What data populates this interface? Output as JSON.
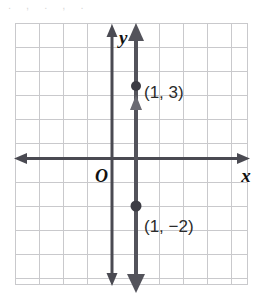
{
  "figure": {
    "top_cut_text": ". , . , .",
    "colors": {
      "grid": "#c9c9cc",
      "grid_border": "#bdbdc1",
      "axis": "#4a4a52",
      "line": "#53535b",
      "point": "#3c3c44",
      "label_text": "#2b2b2b",
      "background": "#ffffff"
    },
    "axes": {
      "x_label": "x",
      "y_label": "y",
      "origin_label": "O",
      "x_axis_name": "x-axis",
      "y_axis_name": "y-axis"
    },
    "grid": {
      "columns": 10,
      "rows": 11,
      "cell_size": 24,
      "left": 15,
      "top": 23,
      "right": 248,
      "bottom": 285
    },
    "plot": {
      "type": "vertical-line",
      "equation_x": 1,
      "line_name": "line-x-equals-1",
      "points": [
        {
          "label": "(1, 3)",
          "x": 1,
          "y": 3,
          "px": 136,
          "py": 86
        },
        {
          "label": "(1, −2)",
          "x": 1,
          "y": -2,
          "px": 136,
          "py": 206
        }
      ]
    }
  }
}
